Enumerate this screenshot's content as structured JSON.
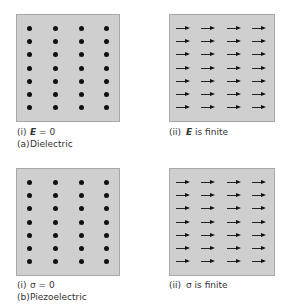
{
  "figure": {
    "panels": [
      {
        "id": "a-i",
        "type": "dots",
        "rows": 7,
        "cols": 4,
        "label": {
          "num": "(i)",
          "symbol": "E",
          "symbol_bold": true,
          "text": " = 0"
        },
        "caption": {
          "num": "(a)",
          "text": "Dielectric"
        }
      },
      {
        "id": "a-ii",
        "type": "arrows",
        "rows": 7,
        "cols": 4,
        "label": {
          "num": "(ii)",
          "symbol": "E",
          "symbol_bold": true,
          "text": " is finite"
        }
      },
      {
        "id": "b-i",
        "type": "dots",
        "rows": 7,
        "cols": 4,
        "label": {
          "num": "(i)",
          "symbol": "σ",
          "symbol_bold": false,
          "text": " = 0"
        },
        "caption": {
          "num": "(b)",
          "text": "Piezoelectric"
        }
      },
      {
        "id": "b-ii",
        "type": "arrows",
        "rows": 7,
        "cols": 4,
        "label": {
          "num": "(ii)",
          "symbol": "σ",
          "symbol_bold": false,
          "text": " is finite"
        }
      }
    ],
    "colors": {
      "panel_fill": "#cfcfcf",
      "panel_border": "#a8a8a8",
      "marker": "#111111"
    }
  }
}
